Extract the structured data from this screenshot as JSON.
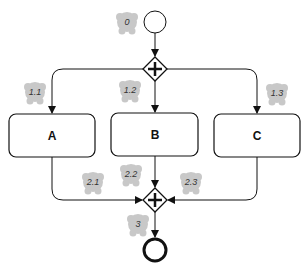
{
  "diagram": {
    "type": "bpmn-parallel-gateway",
    "start_event": {
      "label": ""
    },
    "split_gateway": {
      "symbol": "+"
    },
    "join_gateway": {
      "symbol": "+"
    },
    "end_event": {
      "label": ""
    },
    "tasks": [
      {
        "id": "A",
        "label": "A"
      },
      {
        "id": "B",
        "label": "B"
      },
      {
        "id": "C",
        "label": "C"
      }
    ],
    "tokens": [
      {
        "label": "0"
      },
      {
        "label": "1.1"
      },
      {
        "label": "1.2"
      },
      {
        "label": "1.3"
      },
      {
        "label": "2.1"
      },
      {
        "label": "2.2"
      },
      {
        "label": "2.3"
      },
      {
        "label": "3"
      }
    ],
    "colors": {
      "stroke": "#111111",
      "token": "#c8c8c8",
      "background": "#ffffff"
    }
  }
}
